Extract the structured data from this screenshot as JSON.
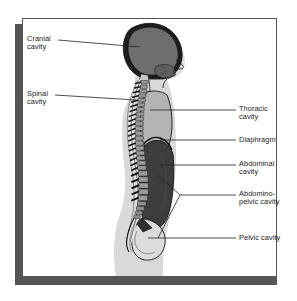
{
  "figure": {
    "frame_color": "#555555",
    "shadow_color": "#555555",
    "background": "#ffffff"
  },
  "palette": {
    "outline": "#111111",
    "skin": "#d9d9d9",
    "skin_light": "#e4e4e4",
    "cranial_cavity": "#6e6e6e",
    "thoracic_cavity": "#b4b4b4",
    "abdominal_cavity": "#3d3d3d",
    "pelvic_cavity": "#dcdcdc",
    "bone": "#9a9a9a",
    "leader_line": "#222222"
  },
  "labels": {
    "left": [
      {
        "id": "cranial-cavity",
        "text": "Cranial\ncavity"
      },
      {
        "id": "spinal-cavity",
        "text": "Spinal\ncavity"
      }
    ],
    "right": [
      {
        "id": "thoracic-cavity",
        "text": "Thoracic\ncavity"
      },
      {
        "id": "diaphragm",
        "text": "Diaphragm"
      },
      {
        "id": "abdominal-cavity",
        "text": "Abdominal\ncavity"
      },
      {
        "id": "abdominopelvic-cavity",
        "text": "Abdomino-\npelvic cavity"
      },
      {
        "id": "pelvic-cavity",
        "text": "Pelvic cavity"
      }
    ]
  },
  "structures": [
    {
      "id": "skull",
      "name": "skull"
    },
    {
      "id": "brain",
      "name": "brain-in-cranial-cavity"
    },
    {
      "id": "vertebral-column",
      "name": "vertebral-column"
    },
    {
      "id": "spinal-canal",
      "name": "spinal-canal"
    },
    {
      "id": "thorax",
      "name": "thoracic-cavity-region"
    },
    {
      "id": "diaphragm-line",
      "name": "diaphragm-boundary"
    },
    {
      "id": "abdomen",
      "name": "abdominal-cavity-region"
    },
    {
      "id": "pelvis",
      "name": "pelvic-cavity-region"
    },
    {
      "id": "body-silhouette",
      "name": "body-silhouette"
    }
  ]
}
